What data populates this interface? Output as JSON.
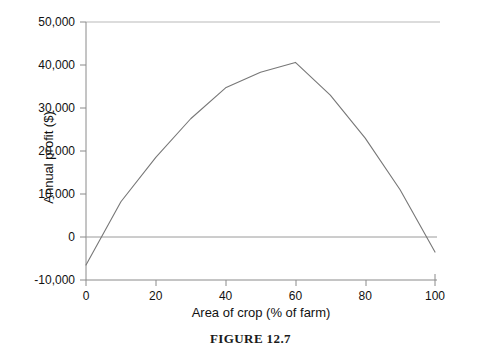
{
  "figure": {
    "caption": "FIGURE 12.7"
  },
  "chart_data": {
    "type": "line",
    "title": "",
    "xlabel": "Area of crop (% of farm)",
    "ylabel": "Annual profit ($)",
    "xlim": [
      0,
      100
    ],
    "ylim": [
      -10000,
      50000
    ],
    "xticks": [
      0,
      20,
      40,
      60,
      80,
      100
    ],
    "xtick_labels": [
      "0",
      "20",
      "40",
      "60",
      "80",
      "100"
    ],
    "yticks": [
      -10000,
      0,
      10000,
      20000,
      30000,
      40000,
      50000
    ],
    "ytick_labels": [
      "-10,000",
      "0",
      "10,000",
      "20,000",
      "30,000",
      "40,000",
      "50,000"
    ],
    "grid": false,
    "zero_line": true,
    "legend": "none",
    "series": [
      {
        "name": "Annual profit",
        "color": "#777777",
        "x": [
          0,
          10,
          20,
          30,
          40,
          50,
          60,
          70,
          80,
          90,
          100
        ],
        "values": [
          -6500,
          8200,
          18500,
          27500,
          34700,
          38300,
          40600,
          33000,
          23000,
          11000,
          -3500
        ]
      }
    ],
    "annotations": [
      "Curve crosses zero at about 5% of farm area",
      "Maximum annual profit about 40,600 dollars at 60% of farm area",
      "Curve returns below zero just before 100% of farm area"
    ]
  }
}
